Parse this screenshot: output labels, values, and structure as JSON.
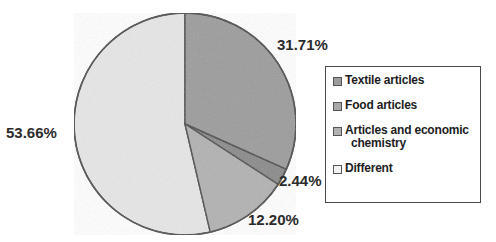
{
  "chart_data": {
    "type": "pie",
    "title": "",
    "subtitle": "",
    "xlabel": "",
    "ylabel": "",
    "grid": false,
    "legend_position": "right",
    "units": "percent",
    "start_angle_deg": 0,
    "direction": "clockwise",
    "categories": [
      "Textile articles",
      "Articles and economic chemistry",
      "Food articles",
      "Different"
    ],
    "values": [
      31.71,
      2.44,
      12.2,
      53.66
    ],
    "labels": [
      "31.71%",
      "2.44%",
      "12.20%",
      "53.66%"
    ],
    "colors": [
      "#9c9c9c",
      "#8a8a8a",
      "#b2b2b2",
      "#e6e6e6"
    ],
    "slices": [
      {
        "name": "Textile articles",
        "value": 31.71,
        "label": "31.71%",
        "color": "#9c9c9c",
        "start_deg": 0,
        "end_deg": 114.156
      },
      {
        "name": "Articles and economic chemistry",
        "value": 2.44,
        "label": "2.44%",
        "color": "#8a8a8a",
        "start_deg": 114.156,
        "end_deg": 122.94
      },
      {
        "name": "Food articles",
        "value": 12.2,
        "label": "12.20%",
        "color": "#b2b2b2",
        "start_deg": 122.94,
        "end_deg": 166.86
      },
      {
        "name": "Different",
        "value": 53.66,
        "label": "53.66%",
        "color": "#e6e6e6",
        "start_deg": 166.86,
        "end_deg": 360
      }
    ],
    "legend": [
      {
        "label": "Textile articles",
        "color": "#9c9c9c"
      },
      {
        "label": "Food articles",
        "color": "#a8a8a8"
      },
      {
        "label_line1": "Articles and economic",
        "label_line2": "chemistry",
        "color": "#b2b2b2"
      },
      {
        "label": "Different",
        "color": "#f2f2f2"
      }
    ]
  },
  "pie_labels": {
    "textile": "31.71%",
    "chemistry": "2.44%",
    "food": "12.20%",
    "different": "53.66%"
  },
  "legend": {
    "items": [
      {
        "label": "Textile articles"
      },
      {
        "label": "Food articles"
      },
      {
        "label_line1": "Articles and economic",
        "label_line2": "chemistry"
      },
      {
        "label": "Different"
      }
    ]
  },
  "colors": {
    "slice_textile": "#9c9c9c",
    "slice_chemistry": "#8a8a8a",
    "slice_food": "#b2b2b2",
    "slice_different": "#e6e6e6",
    "outline": "#4a4a4a",
    "text": "#2b2b2b",
    "legend_border": "#4a4a4a",
    "background": "#ffffff"
  }
}
